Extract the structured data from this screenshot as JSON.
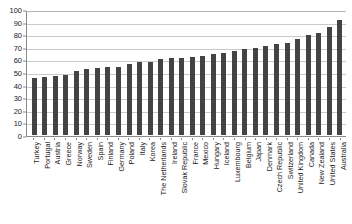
{
  "chart_data": {
    "type": "bar",
    "title": "",
    "subtitle": "",
    "xlabel": "",
    "ylabel": "",
    "ylim": [
      0,
      100
    ],
    "yticks": [
      0,
      10,
      20,
      30,
      40,
      50,
      60,
      70,
      80,
      90,
      100
    ],
    "grid": true,
    "legend": "none",
    "bar_color": "#434343",
    "gridline_color": "#c9c9c9",
    "axis_color": "#8a8a8a",
    "categories": [
      "Turkey",
      "Portugal",
      "Austria",
      "Greece",
      "Norway",
      "Sweden",
      "Spain",
      "Finland",
      "Germany",
      "Poland",
      "Italy",
      "Korea",
      "The Netherlands",
      "Ireland",
      "Slovak Republic",
      "France",
      "Mexico",
      "Hungary",
      "Iceland",
      "Luxembourg",
      "Belgium",
      "Japan",
      "Denmark",
      "Czech Republic",
      "Switzerland",
      "United Kingdom",
      "Canada",
      "New Zealand",
      "United States",
      "Australia"
    ],
    "values": [
      45,
      46,
      47,
      48,
      51,
      52,
      53,
      54,
      54,
      56,
      58,
      58,
      60,
      61,
      61,
      62,
      63,
      64,
      65,
      67,
      68,
      69,
      71,
      72,
      73,
      76,
      79,
      81,
      86,
      91
    ]
  }
}
